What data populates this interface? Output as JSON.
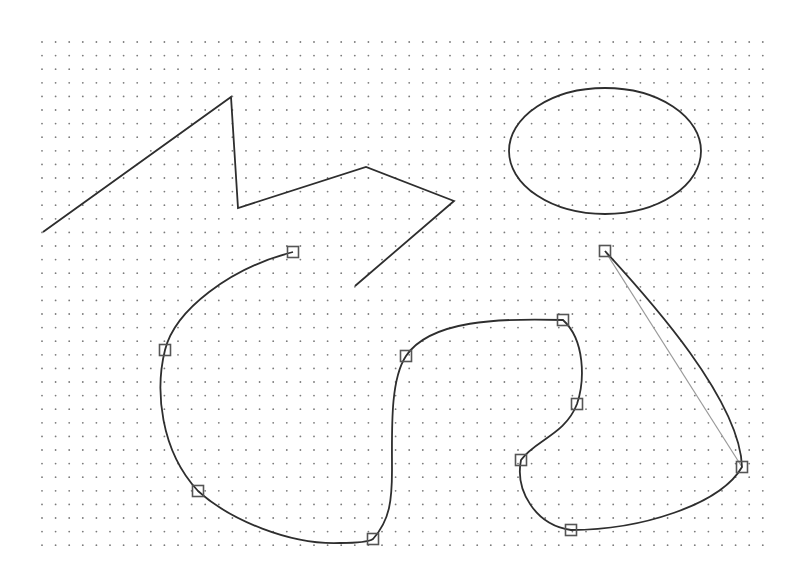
{
  "canvas": {
    "width": 807,
    "height": 587,
    "background": "#ffffff"
  },
  "grid": {
    "origin_x": 42,
    "origin_y": 42,
    "end_x": 763,
    "end_y": 558,
    "spacing_x": 13.6,
    "spacing_y": 13.6,
    "dot_color": "#7a7a7a",
    "dot_radius": 0.9
  },
  "colors": {
    "stroke": "#2e2e2e",
    "handle": "#555555",
    "control_line": "#9a9a9a"
  },
  "shapes": {
    "polyline": {
      "points": [
        [
          43,
          232
        ],
        [
          231,
          97
        ],
        [
          238,
          208
        ],
        [
          366,
          167
        ],
        [
          454,
          201
        ],
        [
          355,
          286
        ]
      ]
    },
    "ellipse": {
      "cx": 605,
      "cy": 151,
      "rx": 96,
      "ry": 63
    },
    "bezier_path": "M 293 252 C 230 268, 175 310, 165 350 C 155 390, 160 450, 198 491 C 230 520, 290 545, 340 543 C 360 543, 370 541, 373 539 C 390 520, 392 500, 392 470 C 392 430, 390 380, 406 356 C 430 320, 500 318, 563 320 C 585 340, 585 380, 577 404 C 565 435, 535 440, 521 460 C 515 490, 535 525, 571 530 C 640 530, 720 505, 742 467 C 740 400, 650 300, 605 251",
    "control_line": {
      "x1": 605,
      "y1": 251,
      "x2": 742,
      "y2": 467
    },
    "handles": [
      {
        "x": 293,
        "y": 252
      },
      {
        "x": 165,
        "y": 350
      },
      {
        "x": 198,
        "y": 491
      },
      {
        "x": 373,
        "y": 539
      },
      {
        "x": 406,
        "y": 356
      },
      {
        "x": 563,
        "y": 320
      },
      {
        "x": 577,
        "y": 404
      },
      {
        "x": 521,
        "y": 460
      },
      {
        "x": 571,
        "y": 530
      },
      {
        "x": 742,
        "y": 467
      },
      {
        "x": 605,
        "y": 251
      }
    ],
    "handle_size": 11
  }
}
